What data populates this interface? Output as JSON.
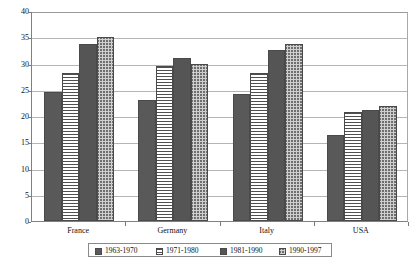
{
  "chart_data": {
    "type": "bar",
    "title": "",
    "subtitle": "",
    "xlabel": "",
    "ylabel": "",
    "ylim": [
      0,
      40
    ],
    "ytick_step": 5,
    "yticks": [
      "0",
      "5",
      "10",
      "15",
      "20",
      "25",
      "30",
      "35",
      "40"
    ],
    "grid": true,
    "legend_position": "bottom",
    "categories": [
      "France",
      "Germany",
      "Italy",
      "USA"
    ],
    "series": [
      {
        "name": "1963-1970",
        "pattern": "solid-dark-gray",
        "values": [
          24.5,
          23.1,
          24.1,
          16.3
        ]
      },
      {
        "name": "1971-1980",
        "pattern": "horizontal-lines",
        "values": [
          28.2,
          29.5,
          28.2,
          20.7
        ]
      },
      {
        "name": "1981-1990",
        "pattern": "dark-checkerboard",
        "values": [
          33.8,
          31.0,
          32.5,
          21.2
        ]
      },
      {
        "name": "1990-1997",
        "pattern": "light-checkerboard",
        "values": [
          35.0,
          29.9,
          33.8,
          22.0
        ]
      }
    ]
  },
  "colors": {
    "series_1": "#595959",
    "series_2": "#ffffff",
    "series_3": "#8d8d8d",
    "series_4": "#cfcfcf",
    "bar_border": "#4a4a4a",
    "gridline": "#b5b5b5",
    "axis": "#808080",
    "text": "#111111",
    "background": "#ffffff"
  }
}
